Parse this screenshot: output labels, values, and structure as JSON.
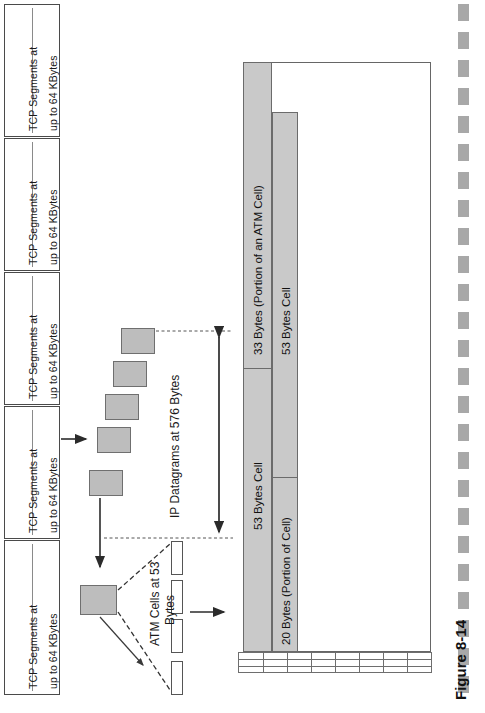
{
  "figure": {
    "caption": "Figure 8-14",
    "orientation": "rotated-90",
    "background": "#ffffff",
    "colors": {
      "fill_gray": "#c9c9c9",
      "box_gray": "#bdbdbd",
      "stroke": "#6b6b6b",
      "rail_gray": "#a8a8a8"
    }
  },
  "tcp_column": {
    "name": "TCP segment stack",
    "boxes": [
      {
        "line1": "TCP Segments at",
        "line2": "up to 64 KBytes"
      },
      {
        "line1": "TCP Segments at",
        "line2": "up to 64 KBytes"
      },
      {
        "line1": "TCP Segments at",
        "line2": "up to 64 KBytes"
      },
      {
        "line1": "TCP Segments at",
        "line2": "up to 64 KBytes"
      },
      {
        "line1": "TCP Segments at",
        "line2": "up to 64 KBytes"
      }
    ]
  },
  "middle": {
    "ip_label": "IP Datagrams at 576 Bytes",
    "atm_label_line1": "ATM Cells at 53",
    "atm_label_line2": "Bytes",
    "ip_datagram_count": 5,
    "atm_cell_count": 4
  },
  "chart_data": {
    "type": "bar",
    "orientation": "horizontal",
    "categories": [
      "33 Bytes (Portion of an ATM Cell)",
      "53 Bytes Cell",
      "53 Bytes Cell",
      "20 Bytes (Portion of Cell)"
    ],
    "values": [
      33,
      53,
      53,
      20
    ],
    "unit": "Bytes",
    "labels": [
      "33 Bytes (Portion of an ATM Cell)",
      "53 Bytes Cell",
      "53 Bytes Cell",
      "20 Bytes (Portion of Cell)"
    ],
    "xlabel": "",
    "ylabel": "",
    "grid": true,
    "legend": "none"
  },
  "bars": [
    {
      "label": "33 Bytes (Portion of an ATM Cell)",
      "bytes": 33
    },
    {
      "label": "53 Bytes Cell",
      "bytes": 53
    },
    {
      "label": "53 Bytes Cell",
      "bytes": 53
    },
    {
      "label": "20 Bytes (Portion of Cell)",
      "bytes": 20
    }
  ],
  "grid_table": {
    "rows": 3,
    "columns": 8
  },
  "rail": {
    "dash_count": 25
  }
}
